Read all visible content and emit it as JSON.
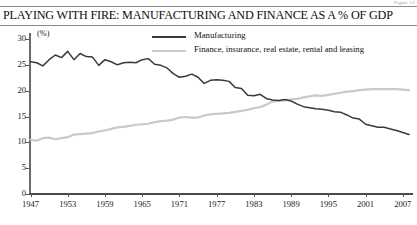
{
  "figure_note": "Figure 13",
  "title": "PLAYING WITH FIRE: MANUFACTURING AND FINANCE AS A % OF GDP",
  "axis": {
    "y_unit": "(%)",
    "y_ticks": [
      "0",
      "5",
      "10",
      "15",
      "20",
      "25",
      "30"
    ],
    "x_ticks": [
      "1947",
      "1953",
      "1959",
      "1965",
      "1971",
      "1977",
      "1983",
      "1989",
      "1995",
      "2001",
      "2007"
    ]
  },
  "legend": {
    "items": [
      {
        "label": "Manufacturing",
        "color": "#3a3a3a"
      },
      {
        "label": "Finance, insurance, real estate, rental and leasing",
        "color": "#c9c9c9"
      }
    ]
  },
  "chart_data": {
    "type": "line",
    "title": "PLAYING WITH FIRE: MANUFACTURING AND FINANCE AS A % OF GDP",
    "xlabel": "",
    "ylabel": "(%)",
    "ylim": [
      0,
      30
    ],
    "xlim": [
      1947,
      2008
    ],
    "grid": false,
    "legend_position": "top-center",
    "x": [
      1947,
      1948,
      1949,
      1950,
      1951,
      1952,
      1953,
      1954,
      1955,
      1956,
      1957,
      1958,
      1959,
      1960,
      1961,
      1962,
      1963,
      1964,
      1965,
      1966,
      1967,
      1968,
      1969,
      1970,
      1971,
      1972,
      1973,
      1974,
      1975,
      1976,
      1977,
      1978,
      1979,
      1980,
      1981,
      1982,
      1983,
      1984,
      1985,
      1986,
      1987,
      1988,
      1989,
      1990,
      1991,
      1992,
      1993,
      1994,
      1995,
      1996,
      1997,
      1998,
      1999,
      2000,
      2001,
      2002,
      2003,
      2004,
      2005,
      2006,
      2007,
      2008
    ],
    "series": [
      {
        "name": "Manufacturing",
        "color": "#3a3a3a",
        "values": [
          25.6,
          25.4,
          24.8,
          26.0,
          26.9,
          26.4,
          27.6,
          26.0,
          27.2,
          26.6,
          26.5,
          24.9,
          26.0,
          25.6,
          25.0,
          25.4,
          25.5,
          25.4,
          26.0,
          26.2,
          25.1,
          24.9,
          24.4,
          23.3,
          22.6,
          22.8,
          23.2,
          22.6,
          21.4,
          22.0,
          22.1,
          22.0,
          21.8,
          20.6,
          20.4,
          19.1,
          19.0,
          19.3,
          18.5,
          18.2,
          18.1,
          18.3,
          18.0,
          17.4,
          16.9,
          16.7,
          16.5,
          16.4,
          16.2,
          15.9,
          15.8,
          15.3,
          14.7,
          14.5,
          13.5,
          13.2,
          12.9,
          12.9,
          12.6,
          12.3,
          11.9,
          11.5
        ]
      },
      {
        "name": "Finance, insurance, real estate, rental and leasing",
        "color": "#c9c9c9",
        "values": [
          10.5,
          10.3,
          10.8,
          10.9,
          10.6,
          10.8,
          11.0,
          11.5,
          11.6,
          11.7,
          11.8,
          12.1,
          12.3,
          12.6,
          12.9,
          13.0,
          13.2,
          13.4,
          13.5,
          13.6,
          13.9,
          14.1,
          14.2,
          14.4,
          14.8,
          14.9,
          14.8,
          14.8,
          15.2,
          15.4,
          15.5,
          15.6,
          15.7,
          15.9,
          16.1,
          16.3,
          16.6,
          16.8,
          17.3,
          17.9,
          18.0,
          18.1,
          18.3,
          18.4,
          18.7,
          18.9,
          19.1,
          19.0,
          19.2,
          19.4,
          19.6,
          19.8,
          19.9,
          20.1,
          20.2,
          20.3,
          20.3,
          20.3,
          20.3,
          20.3,
          20.2,
          20.1
        ]
      }
    ]
  }
}
